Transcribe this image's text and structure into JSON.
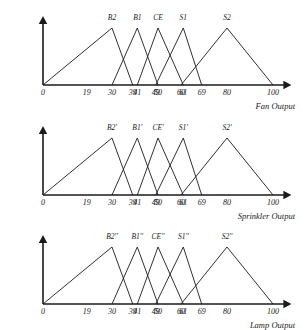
{
  "figure": {
    "type": "fuzzy-membership-triangles",
    "background": "#ffffff",
    "line_color": "#1a1a1a"
  },
  "chart_data": [
    {
      "type": "line",
      "title": "",
      "xlabel": "Fan Output",
      "ylabel": "",
      "xlim": [
        0,
        108
      ],
      "ylim": [
        0,
        1
      ],
      "grid": false,
      "legend": "none",
      "tick_labels": [
        "0",
        "19",
        "30",
        "39",
        "41",
        "49",
        "50",
        "60",
        "61",
        "69",
        "80",
        "100"
      ],
      "tick_values": [
        0,
        19,
        30,
        39,
        41,
        49,
        50,
        60,
        61,
        69,
        80,
        100
      ],
      "series": [
        {
          "name": "B2",
          "label_x": 30,
          "points": [
            [
              0,
              0
            ],
            [
              30,
              1
            ],
            [
              39,
              0
            ]
          ]
        },
        {
          "name": "B1",
          "label_x": 41,
          "points": [
            [
              30,
              0
            ],
            [
              41,
              1
            ],
            [
              50,
              0
            ]
          ]
        },
        {
          "name": "CE",
          "label_x": 50,
          "points": [
            [
              41,
              0
            ],
            [
              50,
              1
            ],
            [
              61,
              0
            ]
          ]
        },
        {
          "name": "S1",
          "label_x": 61,
          "points": [
            [
              49,
              0
            ],
            [
              61,
              1
            ],
            [
              69,
              0
            ]
          ]
        },
        {
          "name": "S2",
          "label_x": 80,
          "points": [
            [
              60,
              0
            ],
            [
              80,
              1
            ],
            [
              100,
              0
            ]
          ]
        }
      ]
    },
    {
      "type": "line",
      "title": "",
      "xlabel": "Sprinkler Output",
      "ylabel": "",
      "xlim": [
        0,
        108
      ],
      "ylim": [
        0,
        1
      ],
      "grid": false,
      "legend": "none",
      "tick_labels": [
        "0",
        "19",
        "30",
        "39",
        "41",
        "49",
        "50",
        "60",
        "61",
        "69",
        "80",
        "100"
      ],
      "tick_values": [
        0,
        19,
        30,
        39,
        41,
        49,
        50,
        60,
        61,
        69,
        80,
        100
      ],
      "series": [
        {
          "name": "B2'",
          "label_x": 30,
          "points": [
            [
              0,
              0
            ],
            [
              30,
              1
            ],
            [
              39,
              0
            ]
          ]
        },
        {
          "name": "B1'",
          "label_x": 41,
          "points": [
            [
              30,
              0
            ],
            [
              41,
              1
            ],
            [
              50,
              0
            ]
          ]
        },
        {
          "name": "CE'",
          "label_x": 50,
          "points": [
            [
              41,
              0
            ],
            [
              50,
              1
            ],
            [
              61,
              0
            ]
          ]
        },
        {
          "name": "S1'",
          "label_x": 61,
          "points": [
            [
              49,
              0
            ],
            [
              61,
              1
            ],
            [
              69,
              0
            ]
          ]
        },
        {
          "name": "S2'",
          "label_x": 80,
          "points": [
            [
              60,
              0
            ],
            [
              80,
              1
            ],
            [
              100,
              0
            ]
          ]
        }
      ]
    },
    {
      "type": "line",
      "title": "",
      "xlabel": "Lamp Output",
      "ylabel": "",
      "xlim": [
        0,
        108
      ],
      "ylim": [
        0,
        1
      ],
      "grid": false,
      "legend": "none",
      "tick_labels": [
        "0",
        "19",
        "30",
        "39",
        "41",
        "49",
        "50",
        "60",
        "61",
        "69",
        "80",
        "100"
      ],
      "tick_values": [
        0,
        19,
        30,
        39,
        41,
        49,
        50,
        60,
        61,
        69,
        80,
        100
      ],
      "series": [
        {
          "name": "B2''",
          "label_x": 30,
          "points": [
            [
              0,
              0
            ],
            [
              30,
              1
            ],
            [
              39,
              0
            ]
          ]
        },
        {
          "name": "B1''",
          "label_x": 41,
          "points": [
            [
              30,
              0
            ],
            [
              41,
              1
            ],
            [
              50,
              0
            ]
          ]
        },
        {
          "name": "CE''",
          "label_x": 50,
          "points": [
            [
              41,
              0
            ],
            [
              50,
              1
            ],
            [
              61,
              0
            ]
          ]
        },
        {
          "name": "S1''",
          "label_x": 61,
          "points": [
            [
              49,
              0
            ],
            [
              61,
              1
            ],
            [
              69,
              0
            ]
          ]
        },
        {
          "name": "S2''",
          "label_x": 80,
          "points": [
            [
              60,
              0
            ],
            [
              80,
              1
            ],
            [
              100,
              0
            ]
          ]
        }
      ]
    }
  ]
}
